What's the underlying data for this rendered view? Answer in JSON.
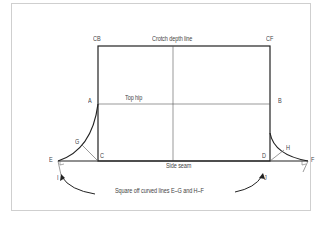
{
  "labels": {
    "cb": "CB",
    "cf": "CF",
    "crotch_depth_line": "Crotch depth line",
    "top_hip": "Top hip",
    "a": "A",
    "b": "B",
    "c": "C",
    "d": "D",
    "e": "E",
    "f": "F",
    "g": "G",
    "h": "H",
    "i": "I",
    "j": "J",
    "side_seam": "Side seam",
    "instruction": "Square off curved lines E–G and H–F"
  },
  "colors": {
    "line": "#222222",
    "thin_line": "#555555",
    "frame": "#cfcfcf",
    "text": "#444444"
  }
}
